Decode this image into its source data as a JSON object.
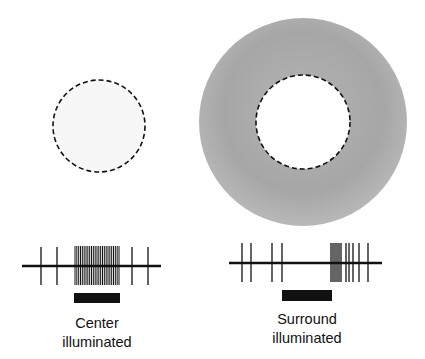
{
  "panels": [
    {
      "id": "center",
      "stimulus": {
        "type": "spot",
        "cx": 99,
        "cy": 126,
        "r": 46,
        "fill": "#f7f7f7",
        "dashed_border": true
      },
      "trace": {
        "baseline": {
          "y": 266,
          "x1": 22,
          "x2": 161
        },
        "spike_top": 247,
        "spike_bottom": 285,
        "spikes": [
          41,
          57,
          132,
          148
        ],
        "burst": {
          "x1": 75,
          "x2": 119,
          "count": 25
        }
      },
      "stimulus_bar": {
        "x": 74,
        "y": 293,
        "w": 46,
        "h": 10
      },
      "label_line1": "Center",
      "label_line2": "illuminated",
      "label_x": 97,
      "label_y": 314
    },
    {
      "id": "surround",
      "stimulus": {
        "type": "annulus",
        "cx": 303,
        "cy": 122,
        "r_outer": 104,
        "r_inner": 47,
        "fill": "#a9a9a9",
        "dashed_border": true
      },
      "trace": {
        "baseline": {
          "y": 263,
          "x1": 229,
          "x2": 382
        },
        "spike_top": 243,
        "spike_bottom": 282,
        "spikes": [
          242,
          251,
          272,
          282,
          331,
          333,
          335,
          337,
          339,
          341,
          346,
          349,
          353,
          359,
          368
        ],
        "burst": null
      },
      "stimulus_bar": {
        "x": 282,
        "y": 290,
        "w": 50,
        "h": 11
      },
      "label_line1": "Surround",
      "label_line2": "illuminated",
      "label_x": 307,
      "label_y": 310
    }
  ],
  "colors": {
    "ink": "#111111",
    "annulus": "#a9a9a9",
    "spot": "#f7f7f7"
  }
}
